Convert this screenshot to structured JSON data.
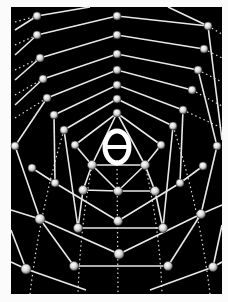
{
  "figure": {
    "center_symbol": "θ",
    "colors": {
      "background": "#000000",
      "border": "#fbfbfb",
      "lines": "#e8e8e8",
      "node_fill": "#f0f0f0",
      "node_shade": "#8a8a8a"
    }
  }
}
